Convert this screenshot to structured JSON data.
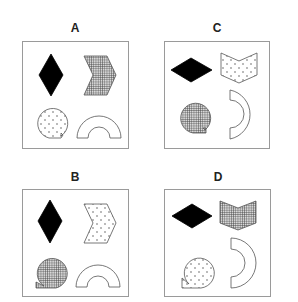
{
  "figure": {
    "colors": {
      "border": "#9a9a9a",
      "shape_stroke": "#555555",
      "solid_fill": "#000000",
      "grid_line": "#444444",
      "dot": "#444444"
    }
  },
  "options": [
    {
      "label": "A",
      "shapes": [
        {
          "shape": "diamond",
          "orientation": "vertical",
          "fill": "solid-black"
        },
        {
          "shape": "chevron",
          "orientation": "pointing-right",
          "fill": "grid"
        },
        {
          "shape": "tailed-circle",
          "tail": "bottom-right",
          "fill": "dotted"
        },
        {
          "shape": "arch",
          "orientation": "open-down",
          "fill": "white"
        }
      ]
    },
    {
      "label": "B",
      "shapes": [
        {
          "shape": "diamond",
          "orientation": "vertical",
          "fill": "solid-black"
        },
        {
          "shape": "chevron",
          "orientation": "pointing-right",
          "fill": "dotted"
        },
        {
          "shape": "tailed-circle",
          "tail": "bottom-left",
          "fill": "grid"
        },
        {
          "shape": "arch",
          "orientation": "open-down",
          "fill": "white"
        }
      ]
    },
    {
      "label": "C",
      "shapes": [
        {
          "shape": "diamond",
          "orientation": "horizontal",
          "fill": "solid-black"
        },
        {
          "shape": "chevron",
          "orientation": "pointing-down",
          "fill": "dotted"
        },
        {
          "shape": "tailed-circle",
          "tail": "bottom-right",
          "fill": "grid"
        },
        {
          "shape": "half-ring",
          "orientation": "open-left",
          "fill": "white"
        }
      ]
    },
    {
      "label": "D",
      "shapes": [
        {
          "shape": "diamond",
          "orientation": "horizontal",
          "fill": "solid-black"
        },
        {
          "shape": "chevron",
          "orientation": "pointing-down",
          "fill": "grid"
        },
        {
          "shape": "tailed-circle",
          "tail": "bottom-left",
          "fill": "dotted"
        },
        {
          "shape": "half-ring",
          "orientation": "open-left",
          "fill": "white"
        }
      ]
    }
  ]
}
